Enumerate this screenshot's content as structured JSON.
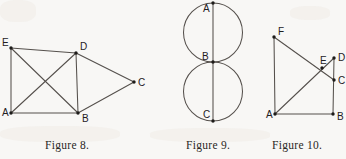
{
  "page": {
    "background_color": "#f8f7f5",
    "ink_color": "#55504c",
    "label_color": "#23201e",
    "width": 346,
    "height": 159
  },
  "captions": {
    "figure8": "Figure 8.",
    "figure9": "Figure 9.",
    "figure10": "Figure 10."
  },
  "figures": [
    {
      "id": "figure-8",
      "caption": "Figure 8.",
      "type": "polygon-diagram",
      "description": "Quadrilateral ABDE with both diagonals drawn, plus triangle BDC attached on the right.",
      "vertices": [
        {
          "label": "E",
          "x": 11,
          "y": 48,
          "label_dx": -9,
          "label_dy": -2
        },
        {
          "label": "D",
          "x": 76,
          "y": 53,
          "label_dx": 4,
          "label_dy": -3
        },
        {
          "label": "C",
          "x": 134,
          "y": 82,
          "label_dx": 4,
          "label_dy": 4
        },
        {
          "label": "A",
          "x": 11,
          "y": 113,
          "label_dx": -9,
          "label_dy": 3
        },
        {
          "label": "B",
          "x": 78,
          "y": 113,
          "label_dx": 4,
          "label_dy": 9
        }
      ],
      "edges": [
        {
          "from": "E",
          "to": "D"
        },
        {
          "from": "E",
          "to": "A"
        },
        {
          "from": "A",
          "to": "B"
        },
        {
          "from": "D",
          "to": "B"
        },
        {
          "from": "E",
          "to": "B"
        },
        {
          "from": "A",
          "to": "D"
        },
        {
          "from": "D",
          "to": "C"
        },
        {
          "from": "B",
          "to": "C"
        }
      ]
    },
    {
      "id": "figure-9",
      "caption": "Figure 9.",
      "type": "circle-diagram",
      "description": "Two equal circles tangent at B, with vertical diameter line from A through B to C.",
      "circles": [
        {
          "name": "upper-circle",
          "cx": 213,
          "cy": 32.5,
          "r": 29.5
        },
        {
          "name": "lower-circle",
          "cx": 213,
          "cy": 91.5,
          "r": 29.5
        }
      ],
      "vertices": [
        {
          "label": "A",
          "x": 213,
          "y": 3,
          "label_dx": -10,
          "label_dy": 9
        },
        {
          "label": "B",
          "x": 213,
          "y": 62,
          "label_dx": -11,
          "label_dy": -2
        },
        {
          "label": "C",
          "x": 213,
          "y": 121,
          "label_dx": -10,
          "label_dy": -3
        }
      ],
      "edges": [
        {
          "from": "A",
          "to": "C"
        }
      ]
    },
    {
      "id": "figure-10",
      "caption": "Figure 10.",
      "type": "polygon-diagram",
      "description": "Right triangle ABF with vertical side AF and base AB; segment FC and segment AD cross at E; short vertical segment DC on the right side above B.",
      "vertices": [
        {
          "label": "F",
          "x": 274,
          "y": 37,
          "label_dx": 4,
          "label_dy": -2
        },
        {
          "label": "D",
          "x": 334,
          "y": 58,
          "label_dx": 4,
          "label_dy": 3
        },
        {
          "label": "E",
          "x": 322,
          "y": 68,
          "label_dx": -2,
          "label_dy": -4
        },
        {
          "label": "C",
          "x": 334,
          "y": 80,
          "label_dx": 4,
          "label_dy": 4
        },
        {
          "label": "A",
          "x": 275,
          "y": 114,
          "label_dx": -9,
          "label_dy": 4
        },
        {
          "label": "B",
          "x": 333,
          "y": 114,
          "label_dx": 4,
          "label_dy": 6
        }
      ],
      "edges": [
        {
          "from": "F",
          "to": "A"
        },
        {
          "from": "A",
          "to": "B"
        },
        {
          "from": "F",
          "to": "C"
        },
        {
          "from": "A",
          "to": "D"
        },
        {
          "from": "D",
          "to": "B"
        }
      ]
    }
  ]
}
